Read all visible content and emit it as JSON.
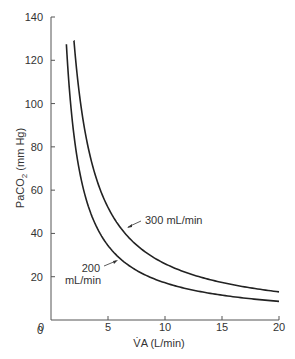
{
  "chart_data": {
    "type": "line",
    "title": "",
    "xlabel": "V̇A (L/min)",
    "ylabel": "PaCO2 (mm Hg)",
    "xlim": [
      0,
      20
    ],
    "ylim": [
      0,
      140
    ],
    "xticks": [
      0,
      5,
      10,
      15,
      20
    ],
    "yticks": [
      0,
      20,
      40,
      60,
      80,
      100,
      120,
      140
    ],
    "grid": false,
    "legend": "none (inline annotations)",
    "series": [
      {
        "name": "200 mL/min",
        "x": [
          1.35,
          1.5,
          2,
          2.5,
          3,
          4,
          5,
          6,
          8,
          10,
          12,
          15,
          20
        ],
        "y": [
          128,
          115,
          86,
          69,
          58,
          43,
          35,
          29,
          22,
          17,
          14,
          11.5,
          8.6
        ]
      },
      {
        "name": "300 mL/min",
        "x": [
          2.0,
          2.5,
          3,
          4,
          5,
          6,
          8,
          10,
          12,
          15,
          20
        ],
        "y": [
          129,
          104,
          86,
          65,
          52,
          43,
          32,
          26,
          22,
          17,
          13
        ]
      }
    ],
    "annotations": [
      {
        "text": "300 mL/min",
        "points_to_series": "300 mL/min"
      },
      {
        "text": "200\nmL/min",
        "points_to_series": "200 mL/min"
      }
    ]
  },
  "labels": {
    "xlabel": "V̇A (L/min)",
    "ylabel_main": "PaCO",
    "ylabel_sub": "2",
    "ylabel_unit": " (mm Hg)",
    "ann_300": "300 mL/min",
    "ann_200_line1": "200",
    "ann_200_line2": "mL/min"
  }
}
